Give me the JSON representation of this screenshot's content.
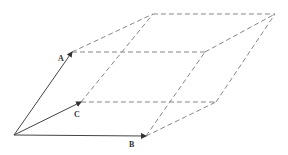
{
  "diagram": {
    "colors": {
      "solid": "#444444",
      "dashed": "#888888",
      "label": "#333333",
      "background": "#ffffff"
    },
    "points": {
      "O": [
        14,
        135
      ],
      "A": [
        72,
        52
      ],
      "B": [
        146,
        136
      ],
      "C": [
        81,
        102
      ],
      "AB": [
        205,
        52
      ],
      "AC": [
        153,
        14
      ],
      "BC": [
        216,
        102
      ],
      "ABC": [
        275,
        14
      ]
    },
    "vectors": [
      {
        "name": "A",
        "label": "A",
        "from": "O",
        "to": "A",
        "label_pos": [
          58,
          61
        ]
      },
      {
        "name": "B",
        "label": "B",
        "from": "O",
        "to": "B",
        "label_pos": [
          129,
          147
        ]
      },
      {
        "name": "C",
        "label": "C",
        "from": "O",
        "to": "C",
        "label_pos": [
          74,
          117
        ]
      }
    ],
    "dashed_edges": [
      [
        "A",
        "AB"
      ],
      [
        "A",
        "AC"
      ],
      [
        "B",
        "AB"
      ],
      [
        "B",
        "BC"
      ],
      [
        "C",
        "AC"
      ],
      [
        "C",
        "BC"
      ],
      [
        "AB",
        "ABC"
      ],
      [
        "AC",
        "ABC"
      ],
      [
        "BC",
        "ABC"
      ]
    ]
  }
}
